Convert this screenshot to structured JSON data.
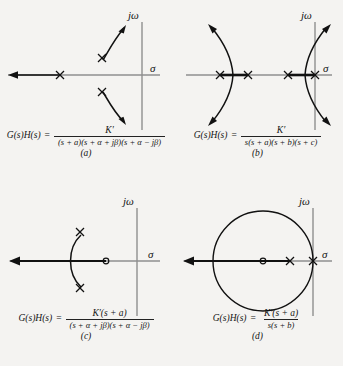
{
  "figure": {
    "background_color": "#f4f3f1",
    "ink_color": "#1a1a1a",
    "axis_color": "#8a8a8a",
    "panel_count": 4
  },
  "axis_labels": {
    "imaginary": "jω",
    "real": "σ"
  },
  "panels": [
    {
      "id": "a",
      "caption": "(a)",
      "formula": {
        "lhs": "G(s)H(s)",
        "equals": "=",
        "numerator": "K′",
        "denominator": "(s + a)(s + α + jβ)(s + α − jβ)"
      },
      "description": "Three poles: one real pole and a complex conjugate pair; loci break away upward and downward",
      "origin": {
        "x": 142,
        "y": 75
      },
      "poles": [
        {
          "x": 60,
          "y": 75,
          "type": "real"
        },
        {
          "x": 102,
          "y": 58,
          "type": "complex"
        },
        {
          "x": 102,
          "y": 92,
          "type": "complex"
        }
      ],
      "zeros": [],
      "real_axis_locus": {
        "from": -999,
        "to": 60
      },
      "branch_arrows": 2
    },
    {
      "id": "b",
      "caption": "(b)",
      "formula": {
        "lhs": "G(s)H(s)",
        "equals": "=",
        "numerator": "K′",
        "denominator": "s(s + a)(s + b)(s + c)"
      },
      "description": "Four real poles including one at the origin; two breakaway points produce two pairs of complex branches crossing the jω axis",
      "origin": {
        "x": 315,
        "y": 75
      },
      "poles": [
        {
          "x": 220,
          "y": 75,
          "type": "real"
        },
        {
          "x": 248,
          "y": 75,
          "type": "real"
        },
        {
          "x": 288,
          "y": 75,
          "type": "real"
        },
        {
          "x": 315,
          "y": 75,
          "type": "real"
        }
      ],
      "zeros": [],
      "branch_arrows": 4
    },
    {
      "id": "c",
      "caption": "(c)",
      "formula": {
        "lhs": "G(s)H(s)",
        "equals": "=",
        "numerator": "K′(s + a)",
        "denominator": "(s + α + jβ)(s + α − jβ)"
      },
      "description": "Complex conjugate pole pair with one real zero; loci form an arc terminating on the zero",
      "origin": {
        "x": 137,
        "y": 261
      },
      "poles": [
        {
          "x": 80,
          "y": 232,
          "type": "complex"
        },
        {
          "x": 80,
          "y": 288,
          "type": "complex"
        }
      ],
      "zeros": [
        {
          "x": 106,
          "y": 261,
          "type": "real"
        }
      ],
      "branch_arrows": 0
    },
    {
      "id": "d",
      "caption": "(d)",
      "formula": {
        "lhs": "G(s)H(s)",
        "equals": "=",
        "numerator": "K′(s + a)",
        "denominator": "s(s + b)"
      },
      "description": "Pole at the origin plus one real pole and one real zero; loci form a circle centred on the zero",
      "origin": {
        "x": 313,
        "y": 261
      },
      "poles": [
        {
          "x": 290,
          "y": 261,
          "type": "real"
        },
        {
          "x": 313,
          "y": 261,
          "type": "real"
        }
      ],
      "zeros": [
        {
          "x": 263,
          "y": 261,
          "type": "real"
        }
      ],
      "circle": {
        "cx": 263,
        "cy": 261,
        "r": 50
      },
      "branch_arrows": 0
    }
  ]
}
